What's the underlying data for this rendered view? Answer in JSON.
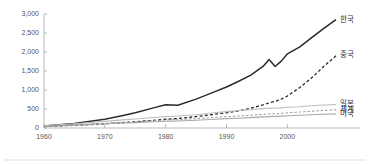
{
  "chart_data": {
    "type": "line",
    "title": "",
    "subtitle": "",
    "xlabel": "",
    "ylabel": "",
    "xlim": [
      1960,
      2008
    ],
    "ylim": [
      0,
      3000
    ],
    "grid": false,
    "legend_position": "right-inline-labels",
    "x_ticks": [
      "1960",
      "1970",
      "1980",
      "1990",
      "2000"
    ],
    "x_tick_values": [
      1960,
      1970,
      1980,
      1990,
      2000
    ],
    "y_ticks": [
      "0",
      "500",
      "1,000",
      "1,500",
      "2,000",
      "2,500",
      "3,000"
    ],
    "y_tick_values": [
      0,
      500,
      1000,
      1500,
      2000,
      2500,
      3000
    ],
    "x": [
      1960,
      1965,
      1970,
      1973,
      1975,
      1978,
      1980,
      1982,
      1985,
      1988,
      1990,
      1992,
      1994,
      1996,
      1997,
      1998,
      1999,
      2000,
      2002,
      2004,
      2006,
      2008
    ],
    "series": [
      {
        "name": "한국",
        "label": "한국",
        "color": "#2b2b2b",
        "style": "solid",
        "width": 1.5,
        "label_x": 2008,
        "label_y": 2850,
        "values": [
          55,
          120,
          230,
          330,
          400,
          530,
          610,
          600,
          760,
          950,
          1080,
          1230,
          1390,
          1620,
          1800,
          1620,
          1760,
          1950,
          2130,
          2380,
          2620,
          2850
        ]
      },
      {
        "name": "중국",
        "label": "중국",
        "color": "#2b2b2b",
        "style": "dashed",
        "width": 1.3,
        "label_x": 2008,
        "label_y": 1920,
        "values": [
          40,
          70,
          110,
          140,
          165,
          200,
          230,
          250,
          300,
          360,
          400,
          450,
          520,
          610,
          660,
          700,
          760,
          840,
          1060,
          1320,
          1620,
          1900
        ]
      },
      {
        "name": "일본",
        "label": "일본",
        "color": "#bdbdbd",
        "style": "solid",
        "width": 1.1,
        "label_x": 2008,
        "label_y": 640,
        "values": [
          60,
          110,
          175,
          215,
          235,
          275,
          300,
          315,
          350,
          400,
          430,
          460,
          480,
          510,
          525,
          520,
          530,
          545,
          560,
          585,
          605,
          620
        ]
      },
      {
        "name": "세계",
        "label": "세계",
        "color": "#9a9a9a",
        "style": "dashed",
        "width": 1.0,
        "label_x": 2008,
        "label_y": 470,
        "values": [
          45,
          80,
          125,
          150,
          165,
          195,
          210,
          220,
          245,
          280,
          300,
          315,
          335,
          360,
          370,
          375,
          385,
          400,
          420,
          440,
          462,
          480
        ]
      },
      {
        "name": "미국",
        "label": "미국",
        "color": "#a8a8a8",
        "style": "solid",
        "width": 1.1,
        "label_x": 2008,
        "label_y": 370,
        "values": [
          42,
          72,
          110,
          130,
          142,
          165,
          178,
          185,
          205,
          232,
          248,
          258,
          272,
          292,
          300,
          305,
          312,
          322,
          335,
          348,
          360,
          372
        ]
      }
    ]
  },
  "colors": {
    "background": "#ffffff",
    "axis": "#aaaaaa",
    "tick_text": "#555555",
    "label_text": "#333333",
    "rule": "#cfcfcf"
  }
}
